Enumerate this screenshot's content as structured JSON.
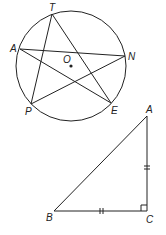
{
  "figure1": {
    "description": "Circle with center O and five points on the circle forming a star (pentagram)",
    "center_label": "O",
    "points": [
      {
        "label": "T"
      },
      {
        "label": "A"
      },
      {
        "label": "N"
      },
      {
        "label": "E"
      },
      {
        "label": "P"
      }
    ],
    "segments": [
      "TP",
      "TE",
      "AN",
      "AE",
      "PN"
    ]
  },
  "figure2": {
    "description": "Right isosceles triangle ABC with right angle at C; AC and BC marked congruent",
    "vertices": [
      {
        "label": "A"
      },
      {
        "label": "B"
      },
      {
        "label": "C"
      }
    ],
    "right_angle_at": "C",
    "congruent_marks": [
      "AC",
      "BC"
    ]
  },
  "colors": {
    "stroke": "#222222",
    "background": "#ffffff"
  }
}
